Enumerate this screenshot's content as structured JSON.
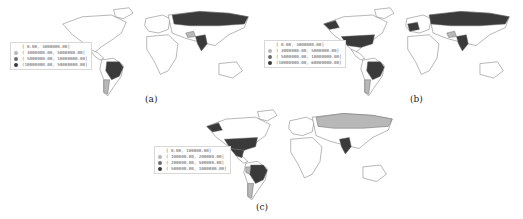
{
  "figure": {
    "panels": [
      {
        "id": "a",
        "caption": "(a)",
        "legend": [
          {
            "label": "[      0.00,  3000000.00]",
            "class": 0
          },
          {
            "label": "( 3000000.00,  5000000.00]",
            "class": 1
          },
          {
            "label": "( 5000000.00, 10000000.00]",
            "class": 2
          },
          {
            "label": "(10000000.00, 50000000.00]",
            "class": 3
          }
        ],
        "highlighted": {
          "dark": [
            "Russia",
            "India",
            "Brazil"
          ],
          "light": [
            "Argentina",
            "Iran"
          ]
        }
      },
      {
        "id": "b",
        "caption": "(b)",
        "legend": [
          {
            "label": "[      0.00,  3000000.00]",
            "class": 0
          },
          {
            "label": "( 3000000.00,  5000000.00]",
            "class": 1
          },
          {
            "label": "( 5000000.00, 10000000.00]",
            "class": 2
          },
          {
            "label": "(10000000.00, 60000000.00]",
            "class": 3
          }
        ],
        "highlighted": {
          "dark": [
            "United States",
            "Alaska",
            "Russia",
            "India",
            "Brazil",
            "Western Europe"
          ],
          "light": [
            "Argentina",
            "Iran"
          ]
        }
      },
      {
        "id": "c",
        "caption": "(c)",
        "legend": [
          {
            "label": "[      0.00,  100000.00]",
            "class": 0
          },
          {
            "label": "( 100000.00,  200000.00]",
            "class": 1
          },
          {
            "label": "( 200000.00,  500000.00]",
            "class": 2
          },
          {
            "label": "( 500000.00, 1000000.00]",
            "class": 3
          }
        ],
        "highlighted": {
          "dark": [
            "United States",
            "Alaska",
            "Mexico",
            "India",
            "Brazil"
          ],
          "light": [
            "Russia",
            "Argentina",
            "Peru"
          ]
        }
      }
    ],
    "colors": {
      "class0": "#ffffff",
      "class1": "#b8b8b8",
      "class2": "#6e6e6e",
      "class3": "#3a3a3a",
      "border": "#555555"
    }
  }
}
